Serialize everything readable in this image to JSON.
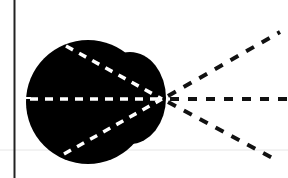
{
  "diagram": {
    "colors": {
      "background": "#ffffff",
      "blob": "#000000",
      "inner_dash": "#ffffff",
      "outer_dash": "#111111",
      "border_line": "#222222",
      "faint_line": "#e4e4e4"
    },
    "focal_point": {
      "x": 162,
      "y": 99
    },
    "inner_rays": [
      {
        "from": [
          60,
          40
        ]
      },
      {
        "from": [
          28,
          98
        ]
      },
      {
        "from": [
          60,
          160
        ]
      }
    ],
    "outer_rays": [
      {
        "to": [
          280,
          32
        ]
      },
      {
        "to": [
          288,
          99
        ]
      },
      {
        "to": [
          276,
          160
        ]
      }
    ]
  }
}
